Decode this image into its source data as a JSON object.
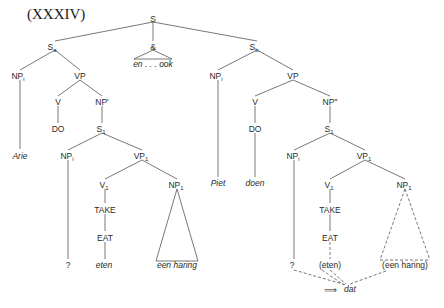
{
  "title": "(XXXIV)",
  "nodes": {
    "S": "S",
    "Sa": "S",
    "Sa_sub": "a",
    "amp": "&",
    "en_ook": "en . . . ook",
    "Sb": "S",
    "Sb_sub": "b",
    "left": {
      "NPi": "NP",
      "NPi_sub": "i",
      "VP": "VP",
      "V": "V",
      "NPprime": "NP'",
      "DO": "DO",
      "S1": "S",
      "S1_sub": "1",
      "arie": "Arie",
      "NPi2": "NP",
      "NPi2_sub": "i",
      "VP1": "VP",
      "VP1_sub": "1",
      "V1": "V",
      "V1_sub": "1",
      "NP1": "NP",
      "NP1_sub": "1",
      "take": "TAKE",
      "eat": "EAT",
      "q": "?",
      "eten": "eten",
      "een_haring": "een haring"
    },
    "right": {
      "NPi": "NP",
      "NPi_sub": "i",
      "VP": "VP",
      "V": "V",
      "NPdprime": "NP\"",
      "DO": "DO",
      "S1": "S",
      "S1_sub": "1",
      "piet": "Piet",
      "doen": "doen",
      "NPi2": "NP",
      "NPi2_sub": "i",
      "VP1": "VP",
      "VP1_sub": "1",
      "V1": "V",
      "V1_sub": "1",
      "NP1": "NP",
      "NP1_sub": "1",
      "take": "TAKE",
      "eat": "EAT",
      "q": "?",
      "eten": "(eten)",
      "een_haring": "(een haring)",
      "arrow": "⟹",
      "dat": "dat"
    }
  }
}
